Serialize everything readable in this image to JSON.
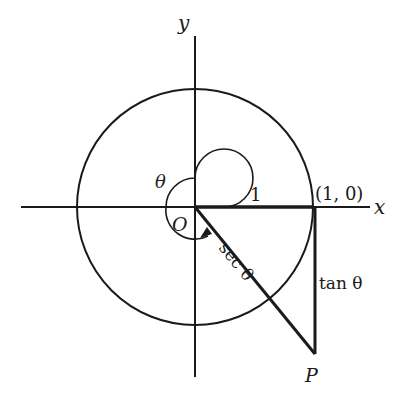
{
  "diagram": {
    "type": "unit-circle-secant-tangent",
    "colors": {
      "stroke": "#1a1a1a",
      "background": "#ffffff"
    },
    "labels": {
      "y_axis": "y",
      "x_axis": "x",
      "origin": "O",
      "theta": "θ",
      "radius": "1",
      "point_1_0": "(1, 0)",
      "sec": "sec θ",
      "tan": "tan θ",
      "point_P": "P"
    },
    "geometry": {
      "center": [
        195,
        207
      ],
      "radius": 118,
      "P": [
        315,
        354
      ]
    }
  }
}
